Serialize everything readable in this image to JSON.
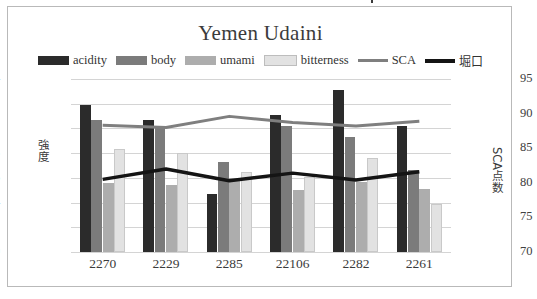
{
  "chart": {
    "title": "Yemen Udaini",
    "legend": [
      {
        "label": "acidity",
        "type": "bar",
        "color": "#2b2b2b",
        "name": "legend-item-acidity"
      },
      {
        "label": "body",
        "type": "bar",
        "color": "#7b7b7b",
        "name": "legend-item-body"
      },
      {
        "label": "umami",
        "type": "bar",
        "color": "#adadad",
        "name": "legend-item-umami"
      },
      {
        "label": "bitterness",
        "type": "bar",
        "color": "#e2e2e2",
        "name": "legend-item-bitterness"
      },
      {
        "label": "SCA",
        "type": "line",
        "color": "#7f7f7f",
        "name": "legend-item-sca"
      },
      {
        "label": "堀口",
        "type": "line",
        "color": "#141414",
        "name": "legend-item-horiguchi"
      }
    ],
    "axis_left_label": "強度",
    "axis_right_label": "SCA点数",
    "left_ticks": [
      "1.4",
      "1.2",
      "1",
      "0.8",
      "0.6",
      "0.4",
      "0.2",
      "0"
    ],
    "right_ticks": [
      "95",
      "90",
      "85",
      "80",
      "75",
      "70"
    ]
  },
  "chart_data": {
    "type": "bar",
    "title": "Yemen Udaini",
    "xlabel": "",
    "ylabel": "強度",
    "y2label": "SCA点数",
    "categories": [
      "2270",
      "2229",
      "2285",
      "22106",
      "2282",
      "2261"
    ],
    "ylim": [
      0,
      1.4
    ],
    "y2lim": [
      70,
      95
    ],
    "yticks": [
      0,
      0.2,
      0.4,
      0.6,
      0.8,
      1.0,
      1.2,
      1.4
    ],
    "y2ticks": [
      70,
      75,
      80,
      85,
      90,
      95
    ],
    "grid": true,
    "legend_position": "top",
    "series": [
      {
        "name": "acidity",
        "kind": "bar",
        "axis": "left",
        "color": "#2b2b2b",
        "values": [
          1.19,
          1.07,
          0.47,
          1.11,
          1.31,
          1.02
        ]
      },
      {
        "name": "body",
        "kind": "bar",
        "axis": "left",
        "color": "#7b7b7b",
        "values": [
          1.07,
          1.02,
          0.73,
          1.02,
          0.93,
          0.66
        ]
      },
      {
        "name": "umami",
        "kind": "bar",
        "axis": "left",
        "color": "#adadad",
        "values": [
          0.56,
          0.54,
          0.6,
          0.5,
          0.57,
          0.51
        ]
      },
      {
        "name": "bitterness",
        "kind": "bar",
        "axis": "left",
        "color": "#e2e2e2",
        "values": [
          0.83,
          0.8,
          0.65,
          0.61,
          0.76,
          0.39
        ]
      },
      {
        "name": "SCA",
        "kind": "line",
        "axis": "right",
        "color": "#7f7f7f",
        "values": [
          88.3,
          88.0,
          89.6,
          88.7,
          88.2,
          88.9
        ]
      },
      {
        "name": "堀口",
        "kind": "line",
        "axis": "right",
        "color": "#141414",
        "values": [
          80.5,
          82.0,
          80.3,
          81.4,
          80.4,
          81.6
        ]
      }
    ]
  }
}
